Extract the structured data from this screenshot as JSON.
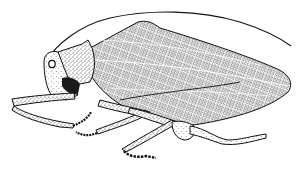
{
  "image": {
    "subject": "katydid illustration",
    "style": "stippled black ink line drawing",
    "background_color": "#ffffff",
    "ink_color": "#111111",
    "parts": [
      "antenna",
      "head",
      "eye",
      "pronotum",
      "forewing",
      "front-leg",
      "middle-leg",
      "hind-leg",
      "ovipositor"
    ]
  }
}
